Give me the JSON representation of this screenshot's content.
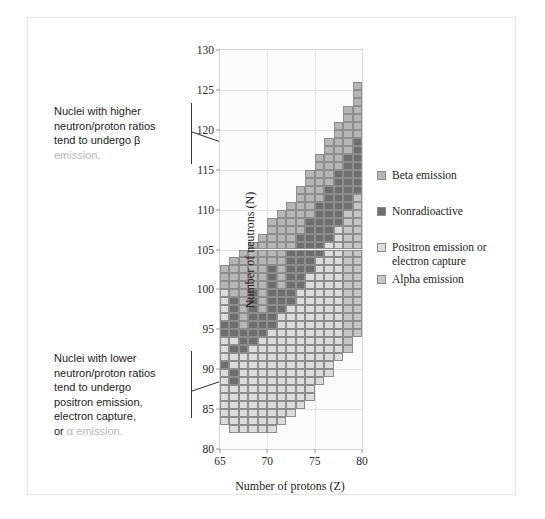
{
  "figure": {
    "background": "#ffffff",
    "border_color": "#e6e6e6"
  },
  "annotations": {
    "top": {
      "line1": "Nuclei with higher",
      "line2": "neutron/proton ratios",
      "line3": "tend to undergo β",
      "line4": "emission.",
      "target_z": 74.5,
      "target_n": 114.5
    },
    "bottom": {
      "line1": "Nuclei with lower",
      "line2": "neutron/proton ratios",
      "line3": "tend to undergo",
      "line4": "positron emission,",
      "line5": "electron capture,",
      "line6_prefix": "or ",
      "line6_rest": "α emission.",
      "target_z": 70.5,
      "target_n": 90.5
    }
  },
  "legend": {
    "title": "",
    "items": [
      {
        "label": "Beta emission",
        "color": "#b6b6b6",
        "key": "beta"
      },
      {
        "label": "Nonradioactive",
        "color": "#6e6e6e",
        "key": "stable"
      },
      {
        "label": "Positron emission or",
        "label2": "electron capture",
        "color": "#dcdcdc",
        "key": "positron"
      },
      {
        "label": "Alpha emission",
        "color": "#c6c6c6",
        "key": "alpha"
      }
    ]
  },
  "chart_data": {
    "type": "heatmap",
    "title": "",
    "xlabel": "Number of protons (Z)",
    "ylabel": "Number of neutrons (N)",
    "xlim": [
      65,
      80
    ],
    "ylim": [
      80,
      130
    ],
    "xticks": [
      65,
      70,
      75,
      80
    ],
    "yticks": [
      80,
      85,
      90,
      95,
      100,
      105,
      110,
      115,
      120,
      125,
      130
    ],
    "grid": true,
    "grid_color": "#e3e3e3",
    "legend_position": "right",
    "cell_size": {
      "z": 1,
      "n": 1
    },
    "categories": [
      "beta",
      "stable",
      "positron",
      "alpha"
    ],
    "category_colors": {
      "beta": "#b6b6b6",
      "stable": "#6e6e6e",
      "positron": "#dcdcdc",
      "alpha": "#c6c6c6"
    },
    "columns": [
      {
        "z": 65,
        "runs": [
          {
            "n0": 83,
            "n1": 90,
            "cat": "positron"
          },
          {
            "n0": 90,
            "n1": 91,
            "cat": "stable"
          },
          {
            "n0": 91,
            "n1": 94,
            "cat": "positron"
          },
          {
            "n0": 94,
            "n1": 96,
            "cat": "stable"
          },
          {
            "n0": 96,
            "n1": 100,
            "cat": "positron"
          },
          {
            "n0": 100,
            "n1": 103,
            "cat": "beta"
          }
        ]
      },
      {
        "z": 66,
        "runs": [
          {
            "n0": 82,
            "n1": 88,
            "cat": "positron"
          },
          {
            "n0": 88,
            "n1": 90,
            "cat": "stable"
          },
          {
            "n0": 90,
            "n1": 92,
            "cat": "positron"
          },
          {
            "n0": 92,
            "n1": 93,
            "cat": "stable"
          },
          {
            "n0": 93,
            "n1": 94,
            "cat": "positron"
          },
          {
            "n0": 94,
            "n1": 99,
            "cat": "stable"
          },
          {
            "n0": 99,
            "n1": 104,
            "cat": "beta"
          }
        ]
      },
      {
        "z": 67,
        "runs": [
          {
            "n0": 82,
            "n1": 89,
            "cat": "positron"
          },
          {
            "n0": 89,
            "n1": 92,
            "cat": "positron"
          },
          {
            "n0": 92,
            "n1": 95,
            "cat": "stable"
          },
          {
            "n0": 95,
            "n1": 98,
            "cat": "beta"
          },
          {
            "n0": 98,
            "n1": 105,
            "cat": "beta"
          }
        ]
      },
      {
        "z": 68,
        "runs": [
          {
            "n0": 82,
            "n1": 93,
            "cat": "positron"
          },
          {
            "n0": 93,
            "n1": 96,
            "cat": "stable"
          },
          {
            "n0": 96,
            "n1": 100,
            "cat": "stable"
          },
          {
            "n0": 100,
            "n1": 106,
            "cat": "beta"
          }
        ]
      },
      {
        "z": 69,
        "runs": [
          {
            "n0": 82,
            "n1": 94,
            "cat": "positron"
          },
          {
            "n0": 94,
            "n1": 97,
            "cat": "stable"
          },
          {
            "n0": 97,
            "n1": 101,
            "cat": "beta"
          },
          {
            "n0": 101,
            "n1": 107,
            "cat": "beta"
          }
        ]
      },
      {
        "z": 70,
        "runs": [
          {
            "n0": 82,
            "n1": 95,
            "cat": "positron"
          },
          {
            "n0": 95,
            "n1": 99,
            "cat": "stable"
          },
          {
            "n0": 99,
            "n1": 103,
            "cat": "stable"
          },
          {
            "n0": 103,
            "n1": 109,
            "cat": "beta"
          }
        ]
      },
      {
        "z": 71,
        "runs": [
          {
            "n0": 83,
            "n1": 97,
            "cat": "positron"
          },
          {
            "n0": 97,
            "n1": 100,
            "cat": "stable"
          },
          {
            "n0": 100,
            "n1": 105,
            "cat": "beta"
          },
          {
            "n0": 105,
            "n1": 110,
            "cat": "beta"
          }
        ]
      },
      {
        "z": 72,
        "runs": [
          {
            "n0": 84,
            "n1": 98,
            "cat": "positron"
          },
          {
            "n0": 98,
            "n1": 105,
            "cat": "stable"
          },
          {
            "n0": 105,
            "n1": 111,
            "cat": "beta"
          }
        ]
      },
      {
        "z": 73,
        "runs": [
          {
            "n0": 85,
            "n1": 100,
            "cat": "positron"
          },
          {
            "n0": 100,
            "n1": 107,
            "cat": "stable"
          },
          {
            "n0": 107,
            "n1": 113,
            "cat": "beta"
          }
        ]
      },
      {
        "z": 74,
        "runs": [
          {
            "n0": 86,
            "n1": 102,
            "cat": "positron"
          },
          {
            "n0": 102,
            "n1": 109,
            "cat": "stable"
          },
          {
            "n0": 109,
            "n1": 115,
            "cat": "beta"
          }
        ]
      },
      {
        "z": 75,
        "runs": [
          {
            "n0": 88,
            "n1": 104,
            "cat": "positron"
          },
          {
            "n0": 104,
            "n1": 111,
            "cat": "stable"
          },
          {
            "n0": 111,
            "n1": 117,
            "cat": "beta"
          }
        ]
      },
      {
        "z": 76,
        "runs": [
          {
            "n0": 89,
            "n1": 106,
            "cat": "positron"
          },
          {
            "n0": 106,
            "n1": 113,
            "cat": "stable"
          },
          {
            "n0": 113,
            "n1": 119,
            "cat": "beta"
          }
        ]
      },
      {
        "z": 77,
        "runs": [
          {
            "n0": 91,
            "n1": 108,
            "cat": "positron"
          },
          {
            "n0": 108,
            "n1": 115,
            "cat": "stable"
          },
          {
            "n0": 115,
            "n1": 121,
            "cat": "beta"
          }
        ]
      },
      {
        "z": 78,
        "runs": [
          {
            "n0": 92,
            "n1": 110,
            "cat": "alpha"
          },
          {
            "n0": 110,
            "n1": 117,
            "cat": "stable"
          },
          {
            "n0": 117,
            "n1": 123,
            "cat": "beta"
          }
        ]
      },
      {
        "z": 79,
        "runs": [
          {
            "n0": 94,
            "n1": 112,
            "cat": "alpha"
          },
          {
            "n0": 112,
            "n1": 119,
            "cat": "stable"
          },
          {
            "n0": 119,
            "n1": 126,
            "cat": "beta"
          }
        ]
      }
    ]
  }
}
